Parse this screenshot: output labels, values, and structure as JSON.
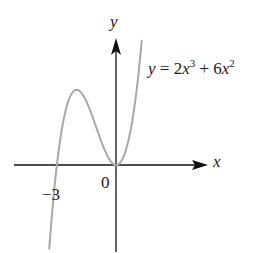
{
  "chart_data": {
    "type": "line",
    "title": "",
    "function": "y = 2x^3 + 6x^2",
    "xlabel": "x",
    "ylabel": "y",
    "x_tick_labels": [
      "-3",
      "0"
    ],
    "x_intercepts": [
      -3,
      0
    ],
    "local_max": {
      "x": -2,
      "y": 8
    },
    "local_min": {
      "x": 0,
      "y": 0
    },
    "x": [
      -3.3,
      -3,
      -2.5,
      -2,
      -1.5,
      -1,
      -0.5,
      0,
      0.5,
      1,
      1.3
    ],
    "y": [
      -6.5,
      0,
      6.25,
      8,
      6.75,
      4,
      1.25,
      0,
      1.75,
      8,
      14.5
    ],
    "grid": false,
    "legend": "none",
    "curve_color": "#a8a8a8",
    "axis_color": "#111111"
  },
  "labels": {
    "y_axis": "y",
    "x_axis": "x",
    "origin": "0",
    "neg_three": "−3",
    "eq_y": "y",
    "eq_eq": " = 2",
    "eq_x1": "x",
    "eq_p1": "3",
    "eq_plus": " + 6",
    "eq_x2": "x",
    "eq_p2": "2"
  }
}
